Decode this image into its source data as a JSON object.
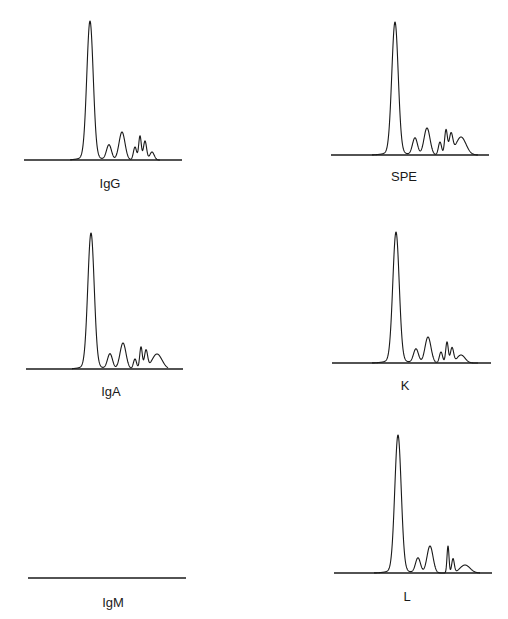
{
  "chart_data": [
    {
      "type": "line",
      "title": "IgG",
      "xlabel": "",
      "ylabel": "",
      "grid": false,
      "baseline": {
        "x1": 24,
        "x2": 182,
        "y": 160
      },
      "label_pos": {
        "x": 110,
        "y": 176
      },
      "peaks": [
        {
          "x": 90,
          "height": 136,
          "width": 3.2
        },
        {
          "x": 109,
          "height": 15,
          "width": 2.5
        },
        {
          "x": 122,
          "height": 28,
          "width": 3.0
        },
        {
          "x": 135,
          "height": 13,
          "width": 1.6
        },
        {
          "x": 140,
          "height": 24,
          "width": 1.3
        },
        {
          "x": 145,
          "height": 19,
          "width": 1.6
        },
        {
          "x": 152,
          "height": 8,
          "width": 2.2
        }
      ],
      "trace_range": [
        70,
        160
      ]
    },
    {
      "type": "line",
      "title": "SPE",
      "xlabel": "",
      "ylabel": "",
      "grid": false,
      "baseline": {
        "x1": 331,
        "x2": 489,
        "y": 155
      },
      "label_pos": {
        "x": 404,
        "y": 169
      },
      "peaks": [
        {
          "x": 395,
          "height": 130,
          "width": 3.2
        },
        {
          "x": 415,
          "height": 17,
          "width": 2.5
        },
        {
          "x": 427,
          "height": 27,
          "width": 3.0
        },
        {
          "x": 440,
          "height": 13,
          "width": 1.6
        },
        {
          "x": 446,
          "height": 25,
          "width": 1.4
        },
        {
          "x": 451,
          "height": 20,
          "width": 1.8
        },
        {
          "x": 461,
          "height": 18,
          "width": 5.0
        }
      ],
      "trace_range": [
        372,
        478
      ]
    },
    {
      "type": "line",
      "title": "IgA",
      "xlabel": "",
      "ylabel": "",
      "grid": false,
      "baseline": {
        "x1": 26,
        "x2": 183,
        "y": 369
      },
      "label_pos": {
        "x": 111,
        "y": 384
      },
      "peaks": [
        {
          "x": 91,
          "height": 133,
          "width": 3.2
        },
        {
          "x": 110,
          "height": 15,
          "width": 2.5
        },
        {
          "x": 123,
          "height": 26,
          "width": 3.0
        },
        {
          "x": 135,
          "height": 10,
          "width": 1.6
        },
        {
          "x": 141,
          "height": 22,
          "width": 1.3
        },
        {
          "x": 146,
          "height": 18,
          "width": 1.6
        },
        {
          "x": 157,
          "height": 15,
          "width": 5.0
        }
      ],
      "trace_range": [
        72,
        168
      ]
    },
    {
      "type": "line",
      "title": "K",
      "xlabel": "",
      "ylabel": "",
      "grid": false,
      "baseline": {
        "x1": 332,
        "x2": 491,
        "y": 363
      },
      "label_pos": {
        "x": 405,
        "y": 378
      },
      "peaks": [
        {
          "x": 396,
          "height": 128,
          "width": 3.2
        },
        {
          "x": 416,
          "height": 14,
          "width": 2.5
        },
        {
          "x": 428,
          "height": 26,
          "width": 3.0
        },
        {
          "x": 441,
          "height": 11,
          "width": 1.6
        },
        {
          "x": 447,
          "height": 21,
          "width": 1.3
        },
        {
          "x": 452,
          "height": 15,
          "width": 1.6
        },
        {
          "x": 461,
          "height": 8,
          "width": 4.0
        }
      ],
      "trace_range": [
        372,
        478
      ]
    },
    {
      "type": "line",
      "title": "IgM",
      "xlabel": "",
      "ylabel": "",
      "grid": false,
      "baseline": {
        "x1": 28,
        "x2": 186,
        "y": 578
      },
      "label_pos": {
        "x": 113,
        "y": 595
      },
      "peaks": [],
      "trace_range": []
    },
    {
      "type": "line",
      "title": "L",
      "xlabel": "",
      "ylabel": "",
      "grid": false,
      "baseline": {
        "x1": 334,
        "x2": 492,
        "y": 573
      },
      "label_pos": {
        "x": 407,
        "y": 589
      },
      "peaks": [
        {
          "x": 398,
          "height": 135,
          "width": 3.2
        },
        {
          "x": 418,
          "height": 15,
          "width": 2.5
        },
        {
          "x": 430,
          "height": 27,
          "width": 3.0
        },
        {
          "x": 448,
          "height": 27,
          "width": 1.0
        },
        {
          "x": 453,
          "height": 14,
          "width": 1.3
        },
        {
          "x": 465,
          "height": 8,
          "width": 5.0
        }
      ],
      "trace_range": [
        374,
        480
      ]
    }
  ]
}
